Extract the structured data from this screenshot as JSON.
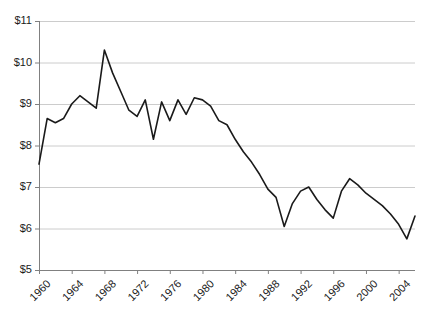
{
  "chart_data": {
    "type": "line",
    "title": "",
    "subtitle": "",
    "xlabel": "",
    "ylabel": "",
    "xlim": [
      1960,
      2006
    ],
    "ylim": [
      5,
      11
    ],
    "grid": true,
    "grid_axis": "y",
    "legend": false,
    "legend_position": "none",
    "line_color": "#1a1a1a",
    "gridline_color": "#cccccc",
    "axis_color": "#808080",
    "y_tick_labels": [
      "$11",
      "$10",
      "$9",
      "$8",
      "$7",
      "$6",
      "$5"
    ],
    "y_tick_values": [
      11,
      10,
      9,
      8,
      7,
      6,
      5
    ],
    "x_tick_labels": [
      "1960",
      "1964",
      "1968",
      "1972",
      "1976",
      "1980",
      "1984",
      "1988",
      "1992",
      "1996",
      "2000",
      "2004"
    ],
    "x_tick_values": [
      1960,
      1964,
      1968,
      1972,
      1976,
      1980,
      1984,
      1988,
      1992,
      1996,
      2000,
      2004
    ],
    "x": [
      1960,
      1961,
      1962,
      1963,
      1964,
      1965,
      1966,
      1967,
      1968,
      1969,
      1970,
      1971,
      1972,
      1973,
      1974,
      1975,
      1976,
      1977,
      1978,
      1979,
      1980,
      1981,
      1982,
      1983,
      1984,
      1985,
      1986,
      1987,
      1988,
      1989,
      1990,
      1991,
      1992,
      1993,
      1994,
      1995,
      1996,
      1997,
      1998,
      1999,
      2000,
      2001,
      2002,
      2003,
      2004,
      2005,
      2006
    ],
    "values": [
      7.55,
      8.65,
      8.55,
      8.65,
      9.0,
      9.2,
      9.05,
      8.9,
      10.3,
      9.75,
      9.3,
      8.85,
      8.7,
      9.1,
      8.15,
      9.05,
      8.6,
      9.1,
      8.75,
      9.15,
      9.1,
      8.95,
      8.6,
      8.5,
      8.15,
      7.85,
      7.6,
      7.3,
      6.95,
      6.75,
      6.05,
      6.6,
      6.9,
      7.0,
      6.7,
      6.45,
      6.25,
      6.9,
      7.2,
      7.05,
      6.85,
      6.7,
      6.55,
      6.35,
      6.1,
      5.75,
      6.3
    ],
    "series": [
      {
        "name": "value",
        "values": [
          7.55,
          8.65,
          8.55,
          8.65,
          9.0,
          9.2,
          9.05,
          8.9,
          10.3,
          9.75,
          9.3,
          8.85,
          8.7,
          9.1,
          8.15,
          9.05,
          8.6,
          9.1,
          8.75,
          9.15,
          9.1,
          8.95,
          8.6,
          8.5,
          8.15,
          7.85,
          7.6,
          7.3,
          6.95,
          6.75,
          6.05,
          6.6,
          6.9,
          7.0,
          6.7,
          6.45,
          6.25,
          6.9,
          7.2,
          7.05,
          6.85,
          6.7,
          6.55,
          6.35,
          6.1,
          5.75,
          6.3
        ]
      }
    ]
  }
}
